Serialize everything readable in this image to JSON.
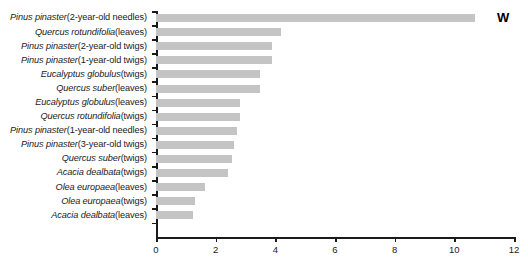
{
  "chart_data": {
    "type": "bar",
    "orientation": "horizontal",
    "title": "",
    "xlabel": "",
    "ylabel": "",
    "xlim": [
      0,
      12
    ],
    "xticks": [
      0,
      2,
      4,
      6,
      8,
      10,
      12
    ],
    "grid": false,
    "legend": null,
    "annotations": [
      {
        "text": "W",
        "position": "top-right"
      }
    ],
    "bar_color": "#c4c4c4",
    "axis_color": "#1a1a1a",
    "categories": [
      "Pinus pinaster (2-year-old needles)",
      "Quercus rotundifolia (leaves)",
      "Pinus pinaster (2-year-old twigs)",
      "Pinus pinaster (1-year-old twigs)",
      "Eucalyptus globulus (twigs)",
      "Quercus suber (leaves)",
      "Eucalyptus globulus (leaves)",
      "Quercus rotundifolia (twigs)",
      "Pinus pinaster (1-year-old needles)",
      "Pinus pinaster (3-year-old twigs)",
      "Quercus suber (twigs)",
      "Acacia dealbata (twigs)",
      "Olea europaea (leaves)",
      "Olea europaea (twigs)",
      "Acacia dealbata (leaves)"
    ],
    "category_parts": [
      {
        "species": "Pinus pinaster",
        "detail": " (2-year-old needles)"
      },
      {
        "species": "Quercus rotundifolia",
        "detail": " (leaves)"
      },
      {
        "species": "Pinus pinaster",
        "detail": " (2-year-old twigs)"
      },
      {
        "species": "Pinus pinaster",
        "detail": " (1-year-old twigs)"
      },
      {
        "species": "Eucalyptus globulus",
        "detail": " (twigs)"
      },
      {
        "species": "Quercus suber",
        "detail": " (leaves)"
      },
      {
        "species": "Eucalyptus globulus",
        "detail": " (leaves)"
      },
      {
        "species": "Quercus rotundifolia",
        "detail": " (twigs)"
      },
      {
        "species": "Pinus pinaster",
        "detail": " (1-year-old needles)"
      },
      {
        "species": "Pinus pinaster",
        "detail": " (3-year-old twigs)"
      },
      {
        "species": "Quercus suber",
        "detail": " (twigs)"
      },
      {
        "species": "Acacia dealbata",
        "detail": " (twigs)"
      },
      {
        "species": "Olea europaea",
        "detail": " (leaves)"
      },
      {
        "species": "Olea europaea",
        "detail": " (twigs)"
      },
      {
        "species": "Acacia dealbata",
        "detail": " (leaves)"
      }
    ],
    "values": [
      10.7,
      4.2,
      3.9,
      3.9,
      3.5,
      3.5,
      2.8,
      2.8,
      2.7,
      2.6,
      2.55,
      2.4,
      1.65,
      1.3,
      1.25
    ]
  }
}
